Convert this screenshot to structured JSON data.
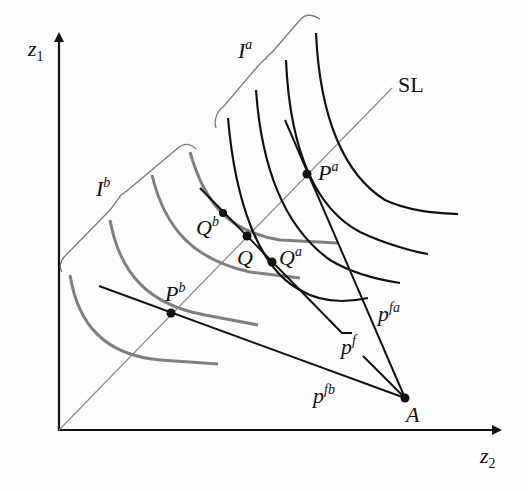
{
  "axes": {
    "y_label": "z",
    "y_label_sub": "1",
    "x_label": "z",
    "x_label_sub": "2"
  },
  "lines": {
    "sl_label": "SL",
    "pfa_label": "p",
    "pfa_sup": "fa",
    "pfb_label": "p",
    "pfb_sup": "fb",
    "pbar_label": "p",
    "pbar_sup": "f"
  },
  "curve_families": {
    "ia_label": "I",
    "ia_sup": "a",
    "ib_label": "I",
    "ib_sup": "b"
  },
  "points": {
    "pa_label": "P",
    "pa_sup": "a",
    "pb_label": "P",
    "pb_sup": "b",
    "q_label": "Q",
    "qa_label": "Q",
    "qa_sup": "a",
    "qb_label": "Q",
    "qb_sup": "b",
    "a_label": "A"
  },
  "colors": {
    "ink": "#111111",
    "gray_curves": "#808080",
    "sl_line": "#8a8a8a"
  }
}
